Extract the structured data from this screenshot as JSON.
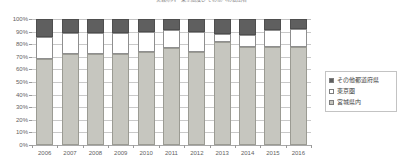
{
  "chart_data": {
    "type": "bar",
    "title": "宮城県内・東京圏及びその他への転出者",
    "xlabel": "",
    "ylabel": "",
    "ylim": [
      0,
      100
    ],
    "ytick_labels": [
      "100%",
      "90%",
      "80%",
      "70%",
      "60%",
      "50%",
      "40%",
      "30%",
      "20%",
      "10%",
      "0%"
    ],
    "ytick_values": [
      100,
      90,
      80,
      70,
      60,
      50,
      40,
      30,
      20,
      10,
      0
    ],
    "grid": true,
    "stacked": true,
    "legend_position": "right",
    "categories": [
      "2006",
      "2007",
      "2008",
      "2009",
      "2010",
      "2011",
      "2012",
      "2013",
      "2014",
      "2015",
      "2016"
    ],
    "series": [
      {
        "name": "宮城県内",
        "color": "#c6c6bf",
        "values": [
          68,
          72,
          72,
          72,
          74,
          77,
          74,
          82,
          78,
          78,
          78
        ]
      },
      {
        "name": "東京圏",
        "color": "#ffffff",
        "values": [
          18,
          17,
          17,
          17,
          16,
          14,
          16,
          6,
          9,
          13,
          14
        ]
      },
      {
        "name": "その他都道府県",
        "color": "#5f5f5f",
        "values": [
          14,
          11,
          11,
          11,
          10,
          9,
          10,
          12,
          13,
          9,
          8
        ]
      }
    ]
  },
  "legend": {
    "items": [
      {
        "label": "その他都道府県",
        "swatch": "dark-gray-swatch"
      },
      {
        "label": "東京圏",
        "swatch": "white-swatch"
      },
      {
        "label": "宮城県内",
        "swatch": "light-gray-swatch"
      }
    ]
  },
  "colors": {
    "segment_bottom": "#c6c6bf",
    "segment_middle": "#ffffff",
    "segment_top": "#5f5f5f",
    "gridline": "#c9c9c9",
    "axis_text": "#5f5f5f"
  }
}
